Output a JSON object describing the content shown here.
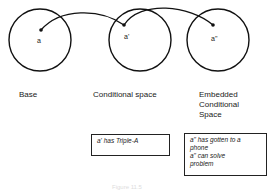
{
  "spaces": [
    {
      "name": "base",
      "label": "Base",
      "point": "a"
    },
    {
      "name": "conditional",
      "label": "Conditional space",
      "point": "a'"
    },
    {
      "name": "embedded",
      "label": "Embedded\nConditional\nSpace",
      "point": "a\""
    }
  ],
  "boxes": {
    "conditional": "a'  has Triple-A",
    "embedded_line1": "a\" has gotten to a",
    "embedded_line2": "phone",
    "embedded_line3": "a\"  can solve",
    "embedded_line4": "problem"
  },
  "caption": "Figure 11.5"
}
